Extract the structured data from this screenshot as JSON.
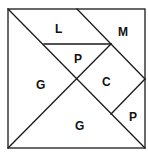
{
  "diagram": {
    "type": "tangram-square",
    "colors": {
      "stroke": "#1a1a1a",
      "fill": "#ffffff",
      "text": "#111111"
    },
    "pieces": [
      {
        "id": "top-left-large-triangle",
        "label": "L"
      },
      {
        "id": "top-right-medium-triangle",
        "label": "M"
      },
      {
        "id": "center-small-triangle",
        "label": "P"
      },
      {
        "id": "left-large-triangle",
        "label": "G"
      },
      {
        "id": "square",
        "label": "C"
      },
      {
        "id": "bottom-large-triangle",
        "label": "G"
      },
      {
        "id": "bottom-right-small-triangle",
        "label": "P"
      }
    ]
  }
}
